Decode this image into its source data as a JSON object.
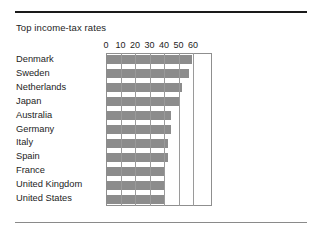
{
  "chart_data": {
    "type": "bar",
    "orientation": "horizontal",
    "title": "Top income-tax rates",
    "xlabel": "",
    "ylabel": "",
    "categories": [
      "Denmark",
      "Sweden",
      "Netherlands",
      "Japan",
      "Australia",
      "Germany",
      "Italy",
      "Spain",
      "France",
      "United Kingdom",
      "United States"
    ],
    "values": [
      59,
      57,
      52,
      50,
      45,
      45,
      43,
      43,
      40,
      40,
      40
    ],
    "xlim": [
      0,
      73
    ],
    "xticks": [
      0,
      10,
      20,
      30,
      40,
      50,
      60
    ],
    "xtick_labels": [
      "0",
      "10",
      "20",
      "30",
      "40",
      "50",
      "60"
    ],
    "grid": true,
    "grid_axis": "x",
    "legend": null,
    "bar_color": "#8c8c8c",
    "frame_color": "#8f8f8f",
    "gridline_color": "#9a9a9a",
    "text_color": "#1d1d1d",
    "rule_top_color": "#1a1a1a",
    "rule_bottom_color": "#8a8a8a"
  }
}
